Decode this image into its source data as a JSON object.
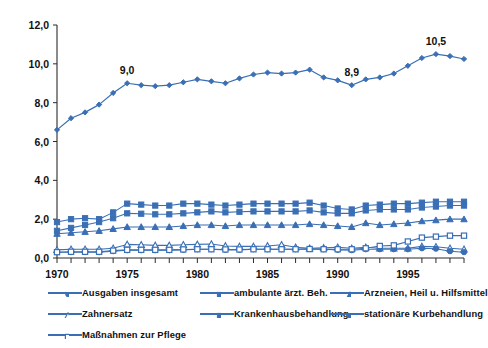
{
  "chart_data": {
    "type": "line",
    "title": "",
    "subtitle": "",
    "xlabel": "",
    "ylabel": "",
    "xlim": [
      1970,
      1999
    ],
    "ylim": [
      0.0,
      12.0
    ],
    "yticks": [
      "0,0",
      "2,0",
      "4,0",
      "6,0",
      "8,0",
      "10,0",
      "12,0"
    ],
    "ytick_values": [
      0.0,
      2.0,
      4.0,
      6.0,
      8.0,
      10.0,
      12.0
    ],
    "xticks": [
      "1970",
      "1975",
      "1980",
      "1985",
      "1990",
      "1995"
    ],
    "xtick_values": [
      1970,
      1975,
      1980,
      1985,
      1990,
      1995
    ],
    "x": [
      1970,
      1971,
      1972,
      1973,
      1974,
      1975,
      1976,
      1977,
      1978,
      1979,
      1980,
      1981,
      1982,
      1983,
      1984,
      1985,
      1986,
      1987,
      1988,
      1989,
      1990,
      1991,
      1992,
      1993,
      1994,
      1995,
      1996,
      1997,
      1998,
      1999
    ],
    "grid": false,
    "legend_position": "bottom",
    "accent_color": "#3a6fb5",
    "annotations": [
      {
        "label": "9,0",
        "x": 1975,
        "y": 9.0
      },
      {
        "label": "8,9",
        "x": 1991,
        "y": 8.9
      },
      {
        "label": "10,5",
        "x": 1997,
        "y": 10.5
      }
    ],
    "series": [
      {
        "name": "Ausgaben insgesamt",
        "marker": "diamond",
        "color": "#3a6fb5",
        "values": [
          6.6,
          7.2,
          7.5,
          7.9,
          8.5,
          9.0,
          8.9,
          8.85,
          8.9,
          9.05,
          9.2,
          9.1,
          9.0,
          9.25,
          9.45,
          9.55,
          9.5,
          9.55,
          9.7,
          9.3,
          9.15,
          8.9,
          9.2,
          9.3,
          9.5,
          9.9,
          10.3,
          10.5,
          10.4,
          10.25
        ]
      },
      {
        "name": "ambulante ärzt. Beh.",
        "marker": "square",
        "color": "#3a6fb5",
        "values": [
          1.85,
          2.0,
          2.05,
          2.0,
          2.35,
          2.8,
          2.75,
          2.7,
          2.7,
          2.8,
          2.8,
          2.75,
          2.7,
          2.75,
          2.8,
          2.8,
          2.8,
          2.8,
          2.85,
          2.7,
          2.55,
          2.5,
          2.7,
          2.75,
          2.8,
          2.8,
          2.85,
          2.9,
          2.9,
          2.9
        ]
      },
      {
        "name": "Arzneien, Heil u. Hilfsmittel",
        "marker": "triangle",
        "color": "#3a6fb5",
        "values": [
          1.25,
          1.3,
          1.35,
          1.4,
          1.5,
          1.6,
          1.6,
          1.6,
          1.6,
          1.65,
          1.7,
          1.7,
          1.65,
          1.7,
          1.7,
          1.7,
          1.7,
          1.7,
          1.75,
          1.7,
          1.65,
          1.6,
          1.8,
          1.7,
          1.75,
          1.8,
          1.9,
          1.95,
          2.0,
          2.0
        ]
      },
      {
        "name": "Zahnersatz",
        "marker": "triangle-open",
        "color": "#3a6fb5",
        "values": [
          0.42,
          0.45,
          0.45,
          0.45,
          0.5,
          0.7,
          0.68,
          0.65,
          0.65,
          0.68,
          0.7,
          0.72,
          0.62,
          0.6,
          0.6,
          0.62,
          0.68,
          0.55,
          0.5,
          0.52,
          0.55,
          0.5,
          0.55,
          0.5,
          0.5,
          0.5,
          0.6,
          0.58,
          0.5,
          0.45
        ]
      },
      {
        "name": "Krankenhausbehandlung",
        "marker": "square-solid",
        "color": "#3a6fb5",
        "values": [
          1.4,
          1.55,
          1.7,
          1.85,
          2.05,
          2.3,
          2.28,
          2.25,
          2.25,
          2.3,
          2.35,
          2.4,
          2.35,
          2.38,
          2.4,
          2.4,
          2.4,
          2.4,
          2.45,
          2.35,
          2.3,
          2.3,
          2.45,
          2.5,
          2.5,
          2.5,
          2.6,
          2.65,
          2.7,
          2.7
        ]
      },
      {
        "name": "stationäre Kurbehandlung",
        "marker": "circle",
        "color": "#3a6fb5",
        "values": [
          0.3,
          0.3,
          0.3,
          0.3,
          0.35,
          0.4,
          0.4,
          0.4,
          0.4,
          0.42,
          0.45,
          0.45,
          0.42,
          0.42,
          0.45,
          0.45,
          0.45,
          0.45,
          0.48,
          0.45,
          0.42,
          0.4,
          0.45,
          0.45,
          0.45,
          0.45,
          0.5,
          0.48,
          0.35,
          0.3
        ]
      },
      {
        "name": "Maßnahmen zur Pflege",
        "marker": "square-open",
        "color": "#3a6fb5",
        "values": [
          0.3,
          0.32,
          0.32,
          0.32,
          0.38,
          0.42,
          0.42,
          0.42,
          0.42,
          0.44,
          0.45,
          0.45,
          0.44,
          0.44,
          0.45,
          0.45,
          0.45,
          0.45,
          0.46,
          0.45,
          0.45,
          0.45,
          0.5,
          0.62,
          0.65,
          0.85,
          1.05,
          1.1,
          1.15,
          1.15
        ]
      }
    ]
  },
  "legend": {
    "rows": [
      [
        "Ausgaben insgesamt",
        "ambulante ärzt. Beh.",
        "Arzneien, Heil u. Hilfsmittel"
      ],
      [
        "Zahnersatz",
        "Krankenhausbehandlung",
        "stationäre Kurbehandlung"
      ],
      [
        "Maßnahmen zur Pflege"
      ]
    ]
  }
}
